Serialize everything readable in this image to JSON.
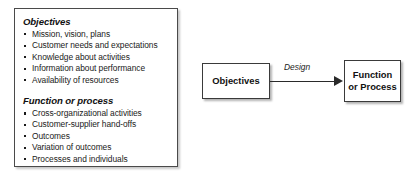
{
  "canvas": {
    "width": 418,
    "height": 184,
    "background_color": "#ffffff"
  },
  "list_panel": {
    "border_color": "#4a4a4a",
    "sections": [
      {
        "heading": "Objectives",
        "items": [
          "Mission, vision, plans",
          "Customer needs and expectations",
          "Knowledge about activities",
          "Information about performance",
          "Availability of resources"
        ]
      },
      {
        "heading": "Function or process",
        "items": [
          "Cross-organizational activities",
          "Customer-supplier hand-offs",
          "Outcomes",
          "Variation of outcomes",
          "Processes and individuals"
        ]
      }
    ]
  },
  "flow_diagram": {
    "source_box": {
      "label": "Objectives"
    },
    "target_box": {
      "label": "Function or Process"
    },
    "connector": {
      "label": "Design",
      "direction": "left-to-right",
      "arrowhead": "solid-triangle",
      "color": "#2a2a2a"
    }
  }
}
